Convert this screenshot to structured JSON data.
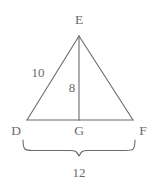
{
  "figure": {
    "type": "geometry-diagram",
    "shape": "triangle-with-altitude",
    "background_color": "#ffffff",
    "stroke_color": "#6b6b6b",
    "text_color": "#6b6b6b"
  },
  "vertices": [
    {
      "id": "E",
      "label": "E",
      "role": "apex",
      "x": 79,
      "y": 36,
      "label_x": 79,
      "label_y": 20
    },
    {
      "id": "D",
      "label": "D",
      "role": "base-left",
      "x": 27,
      "y": 120,
      "label_x": 16,
      "label_y": 131
    },
    {
      "id": "F",
      "label": "F",
      "role": "base-right",
      "x": 133,
      "y": 120,
      "label_x": 143,
      "label_y": 131
    },
    {
      "id": "G",
      "label": "G",
      "role": "altitude-foot",
      "x": 79,
      "y": 120,
      "label_x": 79,
      "label_y": 131
    }
  ],
  "segments": [
    {
      "id": "DE",
      "from": "D",
      "to": "E",
      "kind": "side"
    },
    {
      "id": "EF",
      "from": "E",
      "to": "F",
      "kind": "side"
    },
    {
      "id": "DF",
      "from": "D",
      "to": "F",
      "kind": "base"
    },
    {
      "id": "EG",
      "from": "E",
      "to": "G",
      "kind": "altitude"
    }
  ],
  "measurements": [
    {
      "id": "side-DE",
      "segment": "DE",
      "value": "10",
      "label_x": 38,
      "label_y": 72
    },
    {
      "id": "altitude-EG",
      "segment": "EG",
      "value": "8",
      "label_x": 72,
      "label_y": 87
    },
    {
      "id": "base-DF",
      "segment": "DF",
      "value": "12",
      "label_x": 79,
      "label_y": 172
    }
  ],
  "brace": {
    "id": "base-brace",
    "spans": "DF",
    "left_x": 23,
    "right_x": 135,
    "top_y": 140,
    "tip_x": 79,
    "tip_y": 156
  }
}
